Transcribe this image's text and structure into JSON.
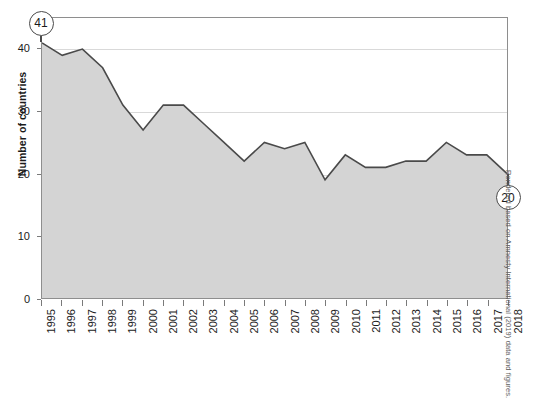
{
  "chart_data": {
    "type": "area",
    "title": "",
    "xlabel": "",
    "ylabel": "Number of countries",
    "ylim": [
      0,
      45
    ],
    "yticks": [
      0,
      10,
      20,
      30,
      40
    ],
    "grid": true,
    "legend": null,
    "x": [
      "1995",
      "1996",
      "1997",
      "1998",
      "1999",
      "2000",
      "2001",
      "2002",
      "2003",
      "2004",
      "2005",
      "2006",
      "2007",
      "2008",
      "2009",
      "2010",
      "2011",
      "2012",
      "2013",
      "2014",
      "2015",
      "2016",
      "2017",
      "2018"
    ],
    "categories": [
      "1995",
      "1996",
      "1997",
      "1998",
      "1999",
      "2000",
      "2001",
      "2002",
      "2003",
      "2004",
      "2005",
      "2006",
      "2007",
      "2008",
      "2009",
      "2010",
      "2011",
      "2012",
      "2013",
      "2014",
      "2015",
      "2016",
      "2017",
      "2018"
    ],
    "values": [
      41,
      39,
      40,
      37,
      31,
      27,
      31,
      31,
      28,
      25,
      22,
      25,
      24,
      25,
      19,
      23,
      21,
      21,
      22,
      22,
      25,
      23,
      23,
      20
    ],
    "series": [
      {
        "name": "Number of countries",
        "values": [
          41,
          39,
          40,
          37,
          31,
          27,
          31,
          31,
          28,
          25,
          22,
          25,
          24,
          25,
          19,
          23,
          21,
          21,
          22,
          22,
          25,
          23,
          23,
          20
        ]
      }
    ],
    "annotations": [
      {
        "label": "41",
        "x": "1995",
        "y": 41,
        "kind": "circle-callout"
      },
      {
        "label": "20",
        "x": "2018",
        "y": 20,
        "kind": "circle-callout"
      }
    ],
    "colors": {
      "area_fill": "#d4d4d4",
      "line": "#4a4a4a",
      "gridline": "#d9d9d9",
      "axis": "#8e8e8e",
      "text": "#1b1b1b"
    }
  },
  "axes": {
    "y_title": "Number of countries",
    "y_tick_labels": [
      "0",
      "10",
      "20",
      "30",
      "40"
    ],
    "x_tick_labels": [
      "1995",
      "1996",
      "1997",
      "1998",
      "1999",
      "2000",
      "2001",
      "2002",
      "2003",
      "2004",
      "2005",
      "2006",
      "2007",
      "2008",
      "2009",
      "2010",
      "2011",
      "2012",
      "2013",
      "2014",
      "2015",
      "2016",
      "2017",
      "2018"
    ]
  },
  "annotations": {
    "start_badge": "41",
    "end_badge": "20"
  },
  "footer": {
    "attribution": "Rendered based on Amnesty International (2019) data and figures."
  }
}
